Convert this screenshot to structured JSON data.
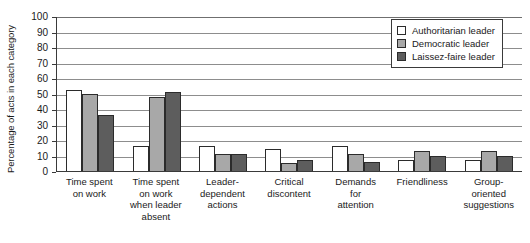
{
  "chart_data": {
    "type": "bar",
    "title": "",
    "xlabel": "",
    "ylabel": "Percentage of acts in each category",
    "ylim": [
      0,
      100
    ],
    "yticks": [
      100,
      90,
      80,
      70,
      60,
      50,
      40,
      30,
      20,
      10,
      0
    ],
    "grid": true,
    "legend_position": "top-right",
    "categories": [
      "Time spent\non work",
      "Time spent\non work\nwhen leader\nabsent",
      "Leader-\ndependent\nactions",
      "Critical\ndiscontent",
      "Demands\nfor\nattention",
      "Friendliness",
      "Group-\noriented\nsuggestions"
    ],
    "series": [
      {
        "name": "Authoritarian leader",
        "color": "#ffffff",
        "values": [
          52,
          16,
          16,
          14,
          16,
          7,
          7
        ]
      },
      {
        "name": "Democratic leader",
        "color": "#a8a8a8",
        "values": [
          50,
          48,
          11,
          5,
          11,
          13,
          13
        ]
      },
      {
        "name": "Laissez-faire leader",
        "color": "#5d5d5d",
        "values": [
          36,
          51,
          11,
          7,
          6,
          10,
          10
        ]
      }
    ]
  },
  "legend": {
    "items": [
      {
        "label": "Authoritarian leader"
      },
      {
        "label": "Democratic leader"
      },
      {
        "label": "Laissez-faire leader"
      }
    ]
  }
}
